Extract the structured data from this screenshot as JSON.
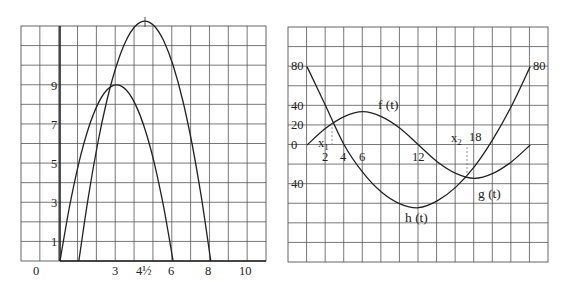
{
  "chart_data": [
    {
      "type": "line",
      "title": "",
      "xlabel": "",
      "ylabel": "",
      "grid": true,
      "xlim": [
        -2,
        11
      ],
      "ylim": [
        0,
        12
      ],
      "x_tick_labels": [
        "0",
        "3",
        "4½",
        "6",
        "8",
        "10"
      ],
      "x_tick_values": [
        0,
        3,
        4.5,
        6,
        8,
        10
      ],
      "y_tick_labels": [
        "1",
        "3",
        "5",
        "7",
        "9"
      ],
      "y_tick_values": [
        1,
        3,
        5,
        7,
        9
      ],
      "series": [
        {
          "name": "parabola-1",
          "formula": "y = 6x - x^2",
          "x": [
            0,
            0.5,
            1,
            1.5,
            2,
            2.5,
            3,
            3.5,
            4,
            4.5,
            5,
            5.5,
            6
          ],
          "y": [
            0,
            2.75,
            5,
            6.75,
            8,
            8.75,
            9,
            8.75,
            8,
            6.75,
            5,
            2.75,
            0
          ]
        },
        {
          "name": "parabola-2",
          "formula": "y = (x - 1)(8 - x)",
          "x": [
            1,
            1.5,
            2,
            2.5,
            3,
            3.5,
            4,
            4.5,
            5,
            5.5,
            6,
            6.5,
            7,
            7.5,
            8
          ],
          "y": [
            0,
            3.25,
            6,
            8.25,
            10,
            11.25,
            12,
            12.25,
            12,
            11.25,
            10,
            8.25,
            6,
            3.25,
            0
          ]
        }
      ],
      "annotations": [
        "vertex of parabola-2 at x = 4½ marked with tick"
      ]
    },
    {
      "type": "line",
      "title": "",
      "xlabel": "",
      "ylabel": "",
      "grid": true,
      "xlim": [
        -2,
        26
      ],
      "ylim": [
        -120,
        120
      ],
      "x_tick_labels": [
        "2",
        "4",
        "6",
        "12",
        "18"
      ],
      "x_tick_values": [
        2,
        4,
        6,
        12,
        18
      ],
      "y_tick_labels": [
        "80",
        "40",
        "20",
        "0",
        "40"
      ],
      "y_tick_values": [
        80,
        40,
        20,
        0,
        -40
      ],
      "right_label": "80",
      "series": [
        {
          "name": "f (t)",
          "x": [
            0,
            2,
            4,
            6,
            8,
            10,
            12,
            14,
            16,
            18,
            20,
            22,
            24
          ],
          "y": [
            0,
            17,
            29,
            34,
            29,
            17,
            0,
            -17,
            -29,
            -34,
            -29,
            -17,
            0
          ]
        },
        {
          "name": "h (t)",
          "x": [
            0,
            2,
            4,
            6,
            8,
            10,
            12,
            14,
            16,
            18,
            20,
            22,
            24
          ],
          "y": [
            80,
            40,
            0,
            -28,
            -48,
            -60,
            -64,
            -57,
            -43,
            -22,
            6,
            40,
            80
          ]
        }
      ],
      "curve_labels": [
        "f (t)",
        "g (t)",
        "h (t)"
      ],
      "annotations": [
        {
          "label": "x1",
          "x": 2.7,
          "note": "intersection of f and h, dashed drop line"
        },
        {
          "label": "x2",
          "x": 17.2,
          "note": "intersection of g and h, dashed line up to axis"
        }
      ]
    }
  ],
  "left": {
    "x_labels": [
      "0",
      "3",
      "4½",
      "6",
      "8",
      "10"
    ],
    "y_labels": [
      "1",
      "3",
      "5",
      "7",
      "9"
    ]
  },
  "right": {
    "y_labels": [
      "80",
      "40",
      "20",
      "0",
      "40"
    ],
    "x_labels": [
      "2",
      "4",
      "6",
      "12",
      "18"
    ],
    "end_label": "80",
    "f_label": "f (t)",
    "g_label": "g (t)",
    "h_label": "h (t)",
    "x1_label": "x",
    "x1_sub": "1",
    "x2_label": "x",
    "x2_sub": "2"
  }
}
